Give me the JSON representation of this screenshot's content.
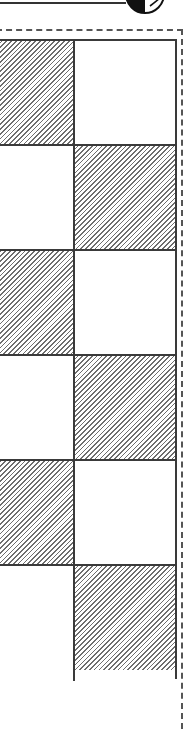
{
  "header": {
    "logo_icon": "half-black-half-white-circle-icon",
    "rule": "horizontal-line"
  },
  "grid": {
    "columns": 2,
    "visible_rows": 6,
    "colors": {
      "line": "#3a3a3a",
      "hatch": "#6e6e6e",
      "background": "#ffffff",
      "dashed_frame": "#555555"
    },
    "rows": [
      {
        "cells": [
          "hatched",
          "plain"
        ]
      },
      {
        "cells": [
          "plain",
          "hatched"
        ]
      },
      {
        "cells": [
          "hatched",
          "plain"
        ]
      },
      {
        "cells": [
          "plain",
          "hatched"
        ]
      },
      {
        "cells": [
          "hatched",
          "plain"
        ]
      },
      {
        "cells": [
          "plain",
          "hatched"
        ]
      }
    ]
  }
}
